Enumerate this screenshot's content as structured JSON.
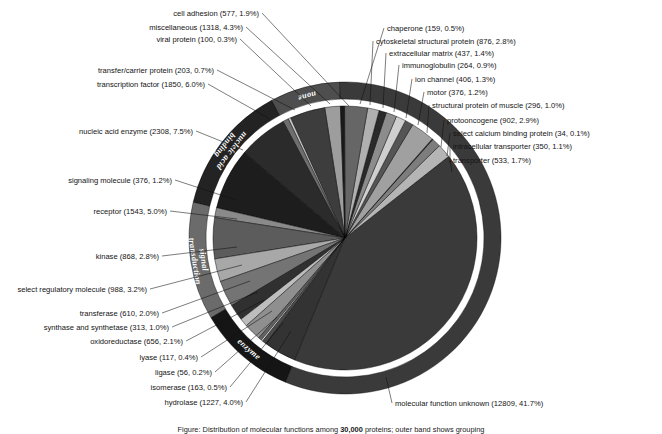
{
  "chart_data": {
    "type": "pie",
    "title": "",
    "total": 30700,
    "center": {
      "x": 345,
      "y": 238
    },
    "radius": 156,
    "inner_radius": 132,
    "ring_gap": 7,
    "start_angle_deg": 92,
    "direction": "counterclockwise",
    "categories": [
      "cell adhesion",
      "miscellaneous",
      "viral protein",
      "transfer/carrier protein",
      "transcription factor",
      "nucleic acid enzyme",
      "signaling molecule",
      "receptor",
      "kinase",
      "select regulatory molecule",
      "transferase",
      "synthase and synthetase",
      "oxidoreductase",
      "lyase",
      "ligase",
      "isomerase",
      "hydrolase",
      "molecular function unknown",
      "transporter",
      "intracellular transporter",
      "select calcium binding protein",
      "protooncogene",
      "structural protein of muscle",
      "motor",
      "ion channel",
      "immunoglobulin",
      "extracellular matrix",
      "cytoskeletal structural protein",
      "chaperone"
    ],
    "values": [
      577,
      1318,
      100,
      203,
      1850,
      2308,
      376,
      1543,
      868,
      988,
      610,
      313,
      656,
      117,
      56,
      163,
      1227,
      12809,
      533,
      350,
      34,
      902,
      296,
      376,
      406,
      264,
      437,
      876,
      159
    ],
    "percents": [
      1.9,
      4.3,
      0.3,
      0.7,
      6.0,
      7.5,
      1.2,
      5.0,
      2.8,
      3.2,
      2.0,
      1.0,
      2.1,
      0.4,
      0.2,
      0.5,
      4.0,
      41.7,
      1.7,
      1.1,
      0.1,
      2.9,
      1.0,
      1.2,
      1.3,
      0.9,
      1.4,
      2.8,
      0.5
    ],
    "greys": [
      "#9d9d9d",
      "#3a3a3a",
      "#c9c9c9",
      "#6e6e6e",
      "#2b2b2b",
      "#1d1d1d",
      "#8a8a8a",
      "#5c5c5c",
      "#a8a8a8",
      "#747474",
      "#2f2f2f",
      "#bdbdbd",
      "#8f8f8f",
      "#636363",
      "#d2d2d2",
      "#4a4a4a",
      "#333333",
      "#3a3a3a",
      "#b5b5b5",
      "#7d7d7d",
      "#1f1f1f",
      "#a0a0a0",
      "#555555",
      "#cfcfcf",
      "#8c8c8c",
      "#2a2a2a",
      "#b0b0b0",
      "#666666",
      "#1a1a1a"
    ],
    "slices": [
      {
        "label": "cell adhesion",
        "count": 577,
        "percent": 1.9,
        "grey": "#9d9d9d"
      },
      {
        "label": "miscellaneous",
        "count": 1318,
        "percent": 4.3,
        "grey": "#3d3d3d"
      },
      {
        "label": "viral protein",
        "count": 100,
        "percent": 0.3,
        "grey": "#c9c9c9"
      },
      {
        "label": "transfer/carrier protein",
        "count": 203,
        "percent": 0.7,
        "grey": "#6e6e6e"
      },
      {
        "label": "transcription factor",
        "count": 1850,
        "percent": 6.0,
        "grey": "#2b2b2b"
      },
      {
        "label": "nucleic acid enzyme",
        "count": 2308,
        "percent": 7.5,
        "grey": "#1d1d1d"
      },
      {
        "label": "signaling molecule",
        "count": 376,
        "percent": 1.2,
        "grey": "#8a8a8a"
      },
      {
        "label": "receptor",
        "count": 1543,
        "percent": 5.0,
        "grey": "#5c5c5c"
      },
      {
        "label": "kinase",
        "count": 868,
        "percent": 2.8,
        "grey": "#a8a8a8"
      },
      {
        "label": "select regulatory molecule",
        "count": 988,
        "percent": 3.2,
        "grey": "#747474"
      },
      {
        "label": "transferase",
        "count": 610,
        "percent": 2.0,
        "grey": "#303030"
      },
      {
        "label": "synthase and synthetase",
        "count": 313,
        "percent": 1.0,
        "grey": "#bdbdbd"
      },
      {
        "label": "oxidoreductase",
        "count": 656,
        "percent": 2.1,
        "grey": "#8f8f8f"
      },
      {
        "label": "lyase",
        "count": 117,
        "percent": 0.4,
        "grey": "#636363"
      },
      {
        "label": "ligase",
        "count": 56,
        "percent": 0.2,
        "grey": "#d2d2d2"
      },
      {
        "label": "isomerase",
        "count": 163,
        "percent": 0.5,
        "grey": "#4a4a4a"
      },
      {
        "label": "hydrolase",
        "count": 1227,
        "percent": 4.0,
        "grey": "#333333"
      },
      {
        "label": "molecular function unknown",
        "count": 12809,
        "percent": 41.7,
        "grey": "#3a3a3a"
      },
      {
        "label": "transporter",
        "count": 533,
        "percent": 1.7,
        "grey": "#b5b5b5"
      },
      {
        "label": "intracellular transporter",
        "count": 350,
        "percent": 1.1,
        "grey": "#7d7d7d"
      },
      {
        "label": "select calcium binding protein",
        "count": 34,
        "percent": 0.1,
        "grey": "#1f1f1f"
      },
      {
        "label": "protooncogene",
        "count": 902,
        "percent": 2.9,
        "grey": "#a0a0a0"
      },
      {
        "label": "structural protein of muscle",
        "count": 296,
        "percent": 1.0,
        "grey": "#555555"
      },
      {
        "label": "motor",
        "count": 376,
        "percent": 1.2,
        "grey": "#cfcfcf"
      },
      {
        "label": "ion channel",
        "count": 406,
        "percent": 1.3,
        "grey": "#8c8c8c"
      },
      {
        "label": "immunoglobulin",
        "count": 264,
        "percent": 0.9,
        "grey": "#2a2a2a"
      },
      {
        "label": "extracellular matrix",
        "count": 437,
        "percent": 1.4,
        "grey": "#b0b0b0"
      },
      {
        "label": "cytoskeletal structural protein",
        "count": 876,
        "percent": 2.8,
        "grey": "#666666"
      },
      {
        "label": "chaperone",
        "count": 159,
        "percent": 0.5,
        "grey": "#1a1a1a"
      }
    ],
    "outer_bands": [
      {
        "label": "nucleic acid binding",
        "from_index": 4,
        "to_index": 5,
        "grey": "#232323",
        "text_color": "#ffffff"
      },
      {
        "label": "none",
        "from_index": 0,
        "to_index": 3,
        "grey": "#4e4e4e",
        "text_color": "#ffffff"
      },
      {
        "label": "signal transduction",
        "from_index": 6,
        "to_index": 9,
        "grey": "#6b6b6b",
        "text_color": "#ffffff"
      },
      {
        "label": "enzyme",
        "from_index": 10,
        "to_index": 16,
        "grey": "#151515",
        "text_color": "#ffffff"
      },
      {
        "label": "",
        "from_index": 17,
        "to_index": 28,
        "grey": "#3a3a3a",
        "text_color": "#ffffff"
      }
    ],
    "legend_position": "callout-labels",
    "grid": false
  },
  "labels": {
    "left": [
      {
        "text": "cell adhesion (577, 1.9%)",
        "x": 259,
        "y": 16,
        "anchor": "end",
        "lx": 262,
        "ly": 13,
        "tx": 349,
        "ty": 106
      },
      {
        "text": "miscellaneous (1318, 4.3%)",
        "x": 243,
        "y": 30,
        "anchor": "end",
        "lx": 246,
        "ly": 27,
        "tx": 330,
        "ty": 104
      },
      {
        "text": "viral protein (100, 0.3%)",
        "x": 237,
        "y": 42,
        "anchor": "end",
        "lx": 240,
        "ly": 39,
        "tx": 311,
        "ty": 106
      },
      {
        "text": "transfer/carrier protein (203, 0.7%)",
        "x": 214,
        "y": 73,
        "anchor": "end",
        "lx": 217,
        "ly": 70,
        "tx": 295,
        "ty": 110
      },
      {
        "text": "transcription factor (1850, 6.0%)",
        "x": 205,
        "y": 87,
        "anchor": "end",
        "lx": 208,
        "ly": 84,
        "tx": 270,
        "ty": 119
      },
      {
        "text": "nucleic acid enzyme (2308, 7.5%)",
        "x": 193,
        "y": 134,
        "anchor": "end",
        "lx": 196,
        "ly": 131,
        "tx": 243,
        "ty": 150
      },
      {
        "text": "signaling molecule (376, 1.2%)",
        "x": 172,
        "y": 183,
        "anchor": "end",
        "lx": 175,
        "ly": 180,
        "tx": 236,
        "ty": 200
      },
      {
        "text": "receptor (1543, 5.0%)",
        "x": 167,
        "y": 214,
        "anchor": "end",
        "lx": 170,
        "ly": 211,
        "tx": 237,
        "ty": 219
      },
      {
        "text": "kinase (868, 2.8%)",
        "x": 159,
        "y": 259,
        "anchor": "end",
        "lx": 162,
        "ly": 256,
        "tx": 237,
        "ty": 247
      },
      {
        "text": "select regulatory molecule (988, 3.2%)",
        "x": 147,
        "y": 292,
        "anchor": "end",
        "lx": 150,
        "ly": 289,
        "tx": 242,
        "ty": 265
      },
      {
        "text": "transferase (610, 2.0%)",
        "x": 159,
        "y": 316,
        "anchor": "end",
        "lx": 162,
        "ly": 313,
        "tx": 250,
        "ty": 281
      },
      {
        "text": "synthase and synthetase (313, 1.0%)",
        "x": 169,
        "y": 330,
        "anchor": "end",
        "lx": 172,
        "ly": 327,
        "tx": 258,
        "ty": 292
      },
      {
        "text": "oxidoreductase (656, 2.1%)",
        "x": 183,
        "y": 344,
        "anchor": "end",
        "lx": 186,
        "ly": 341,
        "tx": 264,
        "ty": 300
      },
      {
        "text": "lyase (117, 0.4%)",
        "x": 198,
        "y": 360,
        "anchor": "end",
        "lx": 201,
        "ly": 357,
        "tx": 272,
        "ty": 311
      },
      {
        "text": "ligase (56, 0.2%)",
        "x": 212,
        "y": 375,
        "anchor": "end",
        "lx": 215,
        "ly": 372,
        "tx": 277,
        "ty": 317
      },
      {
        "text": "isomerase (163, 0.5%)",
        "x": 227,
        "y": 390,
        "anchor": "end",
        "lx": 230,
        "ly": 387,
        "tx": 283,
        "ty": 323
      },
      {
        "text": "hydrolase (1227, 4.0%)",
        "x": 243,
        "y": 405,
        "anchor": "end",
        "lx": 246,
        "ly": 402,
        "tx": 291,
        "ty": 331
      }
    ],
    "right": [
      {
        "text": "chaperone (159, 0.5%)",
        "x": 387,
        "y": 31,
        "anchor": "start",
        "lx": 384,
        "ly": 28,
        "tx": 360,
        "ty": 104
      },
      {
        "text": "cytoskeletal structural protein (876, 2.8%)",
        "x": 376,
        "y": 44,
        "anchor": "start",
        "lx": 373,
        "ly": 41,
        "tx": 370,
        "ty": 105
      },
      {
        "text": "extracellular matrix (437, 1.4%)",
        "x": 389,
        "y": 56,
        "anchor": "start",
        "lx": 386,
        "ly": 53,
        "tx": 383,
        "ty": 108
      },
      {
        "text": "immunoglobulin (264, 0.9%)",
        "x": 402,
        "y": 68,
        "anchor": "start",
        "lx": 399,
        "ly": 65,
        "tx": 394,
        "ty": 112
      },
      {
        "text": "ion channel (406, 1.3%)",
        "x": 415,
        "y": 82,
        "anchor": "start",
        "lx": 412,
        "ly": 79,
        "tx": 406,
        "ty": 118
      },
      {
        "text": "motor (376, 1.2%)",
        "x": 427,
        "y": 95,
        "anchor": "start",
        "lx": 424,
        "ly": 92,
        "tx": 418,
        "ty": 125
      },
      {
        "text": "structural protein of muscle (296, 1.0%)",
        "x": 432,
        "y": 108,
        "anchor": "start",
        "lx": 429,
        "ly": 105,
        "tx": 427,
        "ty": 133
      },
      {
        "text": "protooncogene (902, 2.9%)",
        "x": 447,
        "y": 123,
        "anchor": "start",
        "lx": 444,
        "ly": 120,
        "tx": 441,
        "ty": 147
      },
      {
        "text": "select calcium binding protein (34, 0.1%)",
        "x": 453,
        "y": 136,
        "anchor": "start",
        "lx": 450,
        "ly": 133,
        "tx": 447,
        "ty": 156
      },
      {
        "text": "intracellular transporter (350, 1.1%)",
        "x": 453,
        "y": 149,
        "anchor": "start",
        "lx": 450,
        "ly": 146,
        "tx": 450,
        "ty": 163
      },
      {
        "text": "transporter (533, 1.7%)",
        "x": 453,
        "y": 163,
        "anchor": "start",
        "lx": 450,
        "ly": 160,
        "tx": 452,
        "ty": 172
      },
      {
        "text": "molecular function unknown (12809, 41.7%)",
        "x": 395,
        "y": 406,
        "anchor": "start",
        "lx": 392,
        "ly": 403,
        "tx": 386,
        "ty": 377
      }
    ]
  },
  "caption": {
    "line1_pre": "Figure: Distribution of molecular functions among",
    "line1_bold": "30,000",
    "line1_post": "proteins; outer band shows grouping"
  }
}
